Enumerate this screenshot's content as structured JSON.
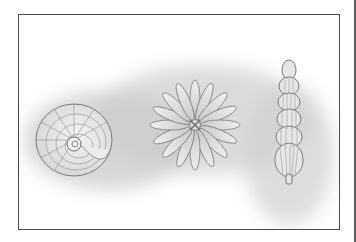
{
  "illustration": {
    "style": "pencil-drawing",
    "subjects": [
      {
        "name": "coiled-shell",
        "position": "left"
      },
      {
        "name": "star-shaped-shell",
        "position": "center"
      },
      {
        "name": "elongated-chambered-shell",
        "position": "right"
      }
    ],
    "colors": {
      "background": "#ffffff",
      "shading": "#c8c8c8",
      "outline": "#6a6a6a",
      "frame": "#4a4a4a"
    }
  }
}
